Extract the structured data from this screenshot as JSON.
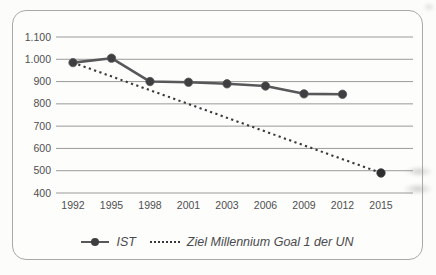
{
  "chart_data": {
    "type": "line",
    "title": "",
    "xlabel": "",
    "ylabel": "",
    "categories": [
      "1992",
      "1995",
      "1998",
      "2001",
      "2003",
      "2006",
      "2009",
      "2012",
      "2015"
    ],
    "ylim": [
      400,
      1100
    ],
    "grid": "horizontal-only",
    "legend_position": "bottom",
    "y_ticks": [
      {
        "value": 1100,
        "label": "1.100"
      },
      {
        "value": 1000,
        "label": "1.000"
      },
      {
        "value": 900,
        "label": "900"
      },
      {
        "value": 800,
        "label": "800"
      },
      {
        "value": 700,
        "label": "700"
      },
      {
        "value": 600,
        "label": "600"
      },
      {
        "value": 500,
        "label": "500"
      },
      {
        "value": 400,
        "label": "400"
      }
    ],
    "series": [
      {
        "name": "IST",
        "style": "solid",
        "marker": "circle-all-points",
        "color": "#58585a",
        "marker_color": "#3f3f41",
        "values": [
          985,
          1005,
          900,
          897,
          890,
          880,
          845,
          843,
          null
        ]
      },
      {
        "name": "Ziel Millennium Goal 1 der UN",
        "style": "dotted",
        "marker": "circle-last-point-only",
        "color": "#3a3a3c",
        "marker_color": "#2e2e30",
        "values": [
          985,
          null,
          null,
          null,
          null,
          null,
          null,
          null,
          490
        ]
      }
    ]
  },
  "colors": {
    "frame_border": "#a9a9a7",
    "gridline": "#8f8f8d",
    "axis_text": "#4f4f51",
    "background": "#fdfdfc"
  }
}
